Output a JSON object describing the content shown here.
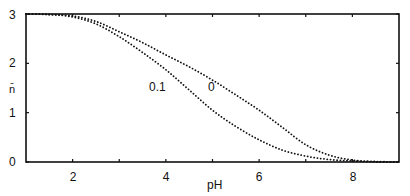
{
  "chart_data": {
    "type": "line",
    "title": "",
    "xlabel": "pH",
    "ylabel": "n̄",
    "xlim": [
      1,
      9
    ],
    "ylim": [
      0,
      3
    ],
    "grid": false,
    "legend": "none (curves labeled inline)",
    "x_ticks": [
      2,
      3,
      4,
      5,
      6,
      7,
      8
    ],
    "x_tick_labels": [
      "2",
      "4",
      "6",
      "8"
    ],
    "y_ticks": [
      0,
      1,
      2,
      3
    ],
    "y_tick_labels": [
      "0",
      "1",
      "2",
      "3"
    ],
    "line_style": "dotted",
    "x": [
      1.0,
      1.5,
      2.0,
      2.5,
      3.0,
      3.5,
      4.0,
      4.5,
      5.0,
      5.5,
      6.0,
      6.5,
      7.0,
      7.5,
      8.0,
      8.5,
      9.0
    ],
    "series": [
      {
        "name": "0",
        "label_position": {
          "pH": 5.0,
          "n": 2.0
        },
        "values": [
          3.0,
          2.99,
          2.96,
          2.85,
          2.64,
          2.42,
          2.17,
          1.93,
          1.66,
          1.36,
          1.05,
          0.7,
          0.35,
          0.14,
          0.04,
          0.01,
          0.0
        ]
      },
      {
        "name": "0.1",
        "label_position": {
          "pH": 3.4,
          "n": 2.0
        },
        "values": [
          3.0,
          2.99,
          2.94,
          2.8,
          2.54,
          2.22,
          1.87,
          1.46,
          1.05,
          0.72,
          0.45,
          0.24,
          0.12,
          0.05,
          0.02,
          0.0,
          0.0
        ]
      }
    ]
  },
  "labels": {
    "ylabel": "n̄",
    "xlabel": "pH",
    "yticks": [
      "0",
      "1",
      "2",
      "3"
    ],
    "xticks": [
      "2",
      "4",
      "6",
      "8"
    ],
    "curve0": "0",
    "curve01": "0.1"
  }
}
